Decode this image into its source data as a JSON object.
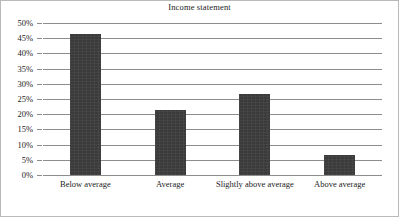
{
  "chart_data": {
    "type": "bar",
    "title": "Income statement",
    "xlabel": "",
    "ylabel": "",
    "categories": [
      "Below average",
      "Average",
      "Slightly above average",
      "Above average"
    ],
    "values": [
      46.5,
      21.3,
      26.5,
      6.6
    ],
    "ylim": [
      0,
      50
    ],
    "ytick_labels": [
      "50%",
      "45%",
      "40%",
      "35%",
      "30%",
      "25%",
      "20%",
      "15%",
      "10%",
      "5%",
      "0%"
    ],
    "ytick_values": [
      50,
      45,
      40,
      35,
      30,
      25,
      20,
      15,
      10,
      5,
      0
    ],
    "grid": true,
    "legend": "none",
    "bar_color": "#3b3b3b",
    "grid_color": "#8d8d8d",
    "frame_color": "#b9b9b9"
  }
}
